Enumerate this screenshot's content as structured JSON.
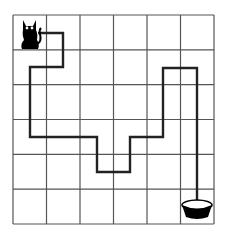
{
  "puzzle": {
    "title": "Cat to bowl maze path",
    "grid": {
      "rows": 6,
      "cols": 6,
      "left": 13,
      "top": 15,
      "right": 214,
      "bottom": 224,
      "line_color": "#555555"
    },
    "path": {
      "color": "#222222",
      "points": [
        [
          38,
          33
        ],
        [
          63,
          33
        ],
        [
          63,
          67
        ],
        [
          30,
          67
        ],
        [
          30,
          137
        ],
        [
          97,
          137
        ],
        [
          97,
          172
        ],
        [
          130,
          172
        ],
        [
          130,
          137
        ],
        [
          163,
          137
        ],
        [
          163,
          68
        ],
        [
          197,
          68
        ],
        [
          197,
          205
        ]
      ]
    },
    "start": {
      "icon": "cat-icon",
      "cell": [
        0,
        0
      ]
    },
    "end": {
      "icon": "bowl-icon",
      "cell": [
        5,
        5
      ]
    }
  }
}
